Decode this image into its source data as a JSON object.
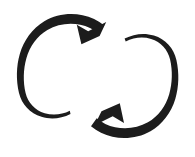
{
  "image": {
    "kind": "scanned-icon",
    "title": "Cycle Arrows Icon",
    "description": "Two interlocking circular arrows forming a double-loop cycle / sync symbol",
    "width": 195,
    "height": 157,
    "background_color": "#ffffff",
    "ink_color": "#1c1c1c"
  },
  "graphic": {
    "stroke_width": 9,
    "left_loop": {
      "name": "left-circular-arrow",
      "center_x": 60,
      "center_y": 76,
      "radius": 40,
      "direction": "clockwise",
      "arrowhead": {
        "tip_x": 82,
        "tip_y": 43,
        "points": "down-left"
      }
    },
    "right_loop": {
      "name": "right-circular-arrow",
      "center_x": 135,
      "center_y": 76,
      "radius": 40,
      "direction": "clockwise",
      "arrowhead": {
        "tip_x": 119,
        "tip_y": 104,
        "points": "up-right"
      }
    }
  }
}
